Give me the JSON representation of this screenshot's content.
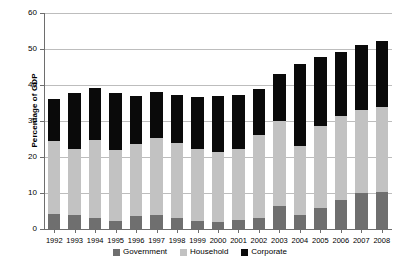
{
  "chart_data": {
    "type": "bar",
    "stacked": true,
    "title": "",
    "xlabel": "",
    "ylabel": "Percentage of GDP",
    "ylim": [
      0,
      60
    ],
    "yticks": [
      0,
      10,
      20,
      30,
      40,
      50,
      60
    ],
    "grid": true,
    "legend_position": "bottom",
    "categories": [
      "1992",
      "1993",
      "1994",
      "1995",
      "1996",
      "1997",
      "1998",
      "1999",
      "2000",
      "2001",
      "2002",
      "2003",
      "2004",
      "2005",
      "2006",
      "2007",
      "2008"
    ],
    "series": [
      {
        "name": "Government",
        "color": "#6f6f6f",
        "values": [
          4.2,
          4.0,
          3.0,
          2.2,
          3.6,
          3.8,
          3.0,
          2.2,
          2.0,
          2.5,
          3.0,
          6.5,
          4.0,
          5.8,
          8.0,
          10.0,
          10.2
        ]
      },
      {
        "name": "Household",
        "color": "#c2c2c2",
        "values": [
          20.3,
          18.3,
          21.8,
          19.8,
          19.9,
          21.4,
          21.0,
          20.0,
          19.5,
          19.7,
          23.0,
          23.5,
          19.0,
          22.7,
          23.5,
          23.0,
          23.8
        ]
      },
      {
        "name": "Corporate",
        "color": "#0a0a0a",
        "values": [
          11.7,
          15.4,
          14.4,
          15.9,
          13.4,
          12.8,
          13.3,
          14.4,
          15.5,
          15.0,
          12.9,
          13.0,
          22.7,
          19.3,
          17.8,
          18.2,
          18.3
        ]
      }
    ],
    "totals": [
      36.2,
      37.7,
      39.2,
      37.7,
      36.9,
      38.0,
      37.3,
      36.6,
      37.0,
      37.2,
      38.9,
      43.0,
      45.7,
      47.8,
      49.3,
      51.2,
      52.3
    ]
  }
}
